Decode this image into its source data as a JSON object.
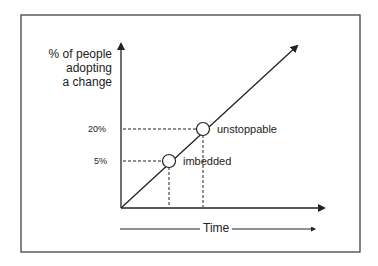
{
  "diagram": {
    "y_axis_label": [
      "% of people",
      "adopting",
      "a change"
    ],
    "x_axis_label": "Time",
    "ticks": [
      {
        "label": "20%",
        "y": 129
      },
      {
        "label": "5%",
        "y": 161
      }
    ],
    "points": [
      {
        "label": "imbedded",
        "x": 169,
        "y": 161,
        "value": "5%"
      },
      {
        "label": "unstoppable",
        "x": 203,
        "y": 129,
        "value": "20%"
      }
    ],
    "colors": {
      "line": "#222222",
      "frame": "#444444",
      "background": "#ffffff"
    }
  }
}
